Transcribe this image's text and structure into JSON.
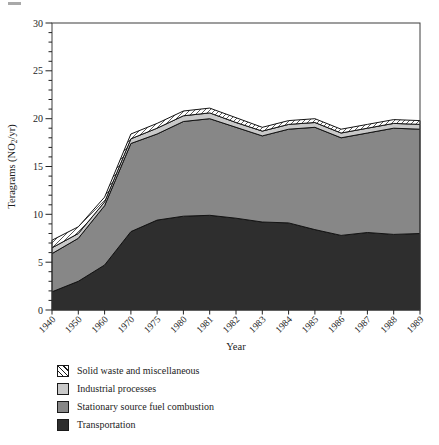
{
  "figure": {
    "background": "#ffffff",
    "frame_color": "#3c3c3c",
    "outline_color": "#141414",
    "text_color": "#1d1d1d"
  },
  "axes": {
    "y_title_prefix": "Teragrams (NO",
    "y_title_sub": "2",
    "y_title_suffix": "/yr)",
    "x_title": "Year"
  },
  "chart_data": {
    "type": "area",
    "stacked": true,
    "title": "",
    "xlabel": "Year",
    "ylabel": "Teragrams (NO2/yr)",
    "ylim": [
      0,
      30
    ],
    "yticks": [
      0,
      5,
      10,
      15,
      20,
      25,
      30
    ],
    "ytick_minor_step": 1,
    "grid": false,
    "legend_position": "below-left",
    "categories": [
      "1940",
      "1950",
      "1960",
      "1970",
      "1975",
      "1980",
      "1981",
      "1982",
      "1983",
      "1984",
      "1985",
      "1986",
      "1987",
      "1988",
      "1989"
    ],
    "series": [
      {
        "name": "Transportation",
        "color": "#2e2e2e",
        "pattern": "solid",
        "values": [
          1.9,
          3.0,
          4.7,
          8.2,
          9.4,
          9.8,
          9.9,
          9.6,
          9.2,
          9.1,
          8.4,
          7.8,
          8.1,
          7.9,
          8.0
        ]
      },
      {
        "name": "Stationary source fuel combustion",
        "color": "#878787",
        "pattern": "solid",
        "values": [
          4.0,
          4.5,
          6.2,
          9.2,
          9.0,
          9.9,
          10.1,
          9.5,
          9.0,
          9.8,
          10.7,
          10.2,
          10.4,
          11.1,
          10.9
        ]
      },
      {
        "name": "Industrial processes",
        "color": "#c9c9c9",
        "pattern": "solid",
        "values": [
          0.6,
          0.5,
          0.4,
          0.5,
          0.6,
          0.6,
          0.6,
          0.5,
          0.5,
          0.5,
          0.5,
          0.5,
          0.5,
          0.5,
          0.5
        ]
      },
      {
        "name": "Solid waste and miscellaneous",
        "color": "#ffffff",
        "pattern": "diagonal-hatch",
        "values": [
          0.8,
          0.7,
          0.5,
          0.5,
          0.5,
          0.5,
          0.5,
          0.5,
          0.4,
          0.4,
          0.4,
          0.4,
          0.4,
          0.4,
          0.4
        ]
      }
    ],
    "totals": [
      7.3,
      8.7,
      11.8,
      18.4,
      19.5,
      20.8,
      21.1,
      20.1,
      19.1,
      19.8,
      20.0,
      18.9,
      19.4,
      19.9,
      19.8
    ]
  },
  "legend": {
    "display_order_top_to_bottom": [
      3,
      2,
      1,
      0
    ]
  }
}
